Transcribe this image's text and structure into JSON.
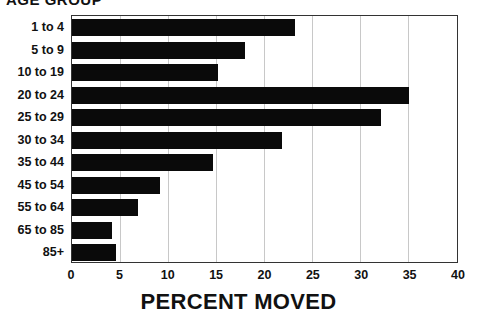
{
  "chart_data": {
    "type": "bar",
    "orientation": "horizontal",
    "title": "AGE GROUP",
    "xlabel": "PERCENT MOVED",
    "ylabel": "",
    "categories": [
      "1 to 4",
      "5 to 9",
      "10 to 19",
      "20 to 24",
      "25 to 29",
      "30 to 34",
      "35 to 44",
      "45 to 54",
      "55 to 64",
      "65 to 85",
      "85+"
    ],
    "values": [
      23.2,
      18.0,
      15.2,
      35.1,
      32.2,
      21.9,
      14.7,
      9.2,
      6.9,
      4.2,
      4.6
    ],
    "xlim": [
      0,
      40
    ],
    "xticks": [
      "0",
      "5",
      "10",
      "15",
      "20",
      "25",
      "30",
      "35",
      "40"
    ],
    "grid": "vertical",
    "bar_color": "#0a0a0a",
    "legend": null
  }
}
